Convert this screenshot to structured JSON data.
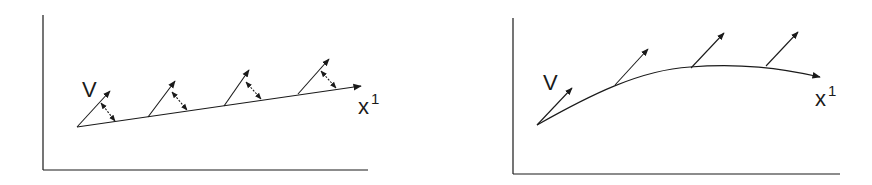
{
  "panels": [
    {
      "id": "left",
      "description": "Straight line x^1 with vector field V and small double-headed arrows (displacement) between vector tips and the line",
      "vector_label": "V",
      "axis_label": "x",
      "axis_label_sup": "1",
      "vector_count": 4
    },
    {
      "id": "right",
      "description": "Curved line x^1 with tangent-like vector field V",
      "vector_label": "V",
      "axis_label": "x",
      "axis_label_sup": "1",
      "vector_count": 4
    }
  ],
  "colors": {
    "stroke": "#1a1a1a",
    "background": "#ffffff"
  }
}
